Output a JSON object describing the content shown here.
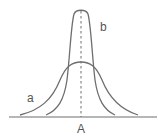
{
  "diagram": {
    "labels": {
      "curve_a": "a",
      "curve_b": "b",
      "center": "A"
    },
    "colors": {
      "stroke": "#6e6e6e",
      "text": "#555555",
      "background": "#ffffff"
    },
    "curves": [
      {
        "name": "a",
        "shape": "wide, low bell curve",
        "peak_x": 81,
        "peak_y": 61
      },
      {
        "name": "b",
        "shape": "narrow, tall bell curve",
        "peak_x": 81,
        "peak_y": 10
      }
    ]
  }
}
